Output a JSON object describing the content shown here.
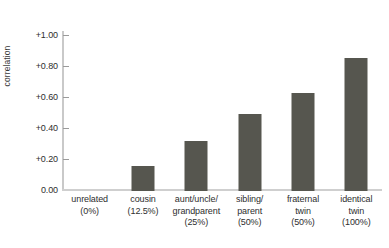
{
  "chart_data": {
    "type": "bar",
    "title": "",
    "subtitle": "",
    "xlabel": "",
    "ylabel": "correlation",
    "ylim": [
      0.0,
      1.1
    ],
    "grid": false,
    "legend": null,
    "bar_color": "#56564f",
    "axis_color": "#c9c9c9",
    "categories": [
      "unrelated (0%)",
      "cousin (12.5%)",
      "aunt/uncle/grandparent (25%)",
      "sibling/parent (50%)",
      "fraternal twin (50%)",
      "identical twin (100%)"
    ],
    "category_lines": [
      [
        "unrelated",
        "(0%)"
      ],
      [
        "cousin",
        "(12.5%)"
      ],
      [
        "aunt/uncle/",
        "grandparent",
        "(25%)"
      ],
      [
        "sibling/",
        "parent",
        "(50%)"
      ],
      [
        "fraternal",
        "twin",
        "(50%)"
      ],
      [
        "identical",
        "twin",
        "(100%)"
      ]
    ],
    "values": [
      0.0,
      0.16,
      0.32,
      0.5,
      0.63,
      0.86
    ],
    "ytick_values": [
      0.0,
      0.2,
      0.4,
      0.6,
      0.8,
      1.0
    ],
    "ytick_labels": [
      "0.00",
      "+0.20",
      "+0.40",
      "+0.60",
      "+0.80",
      "+1.00"
    ]
  }
}
